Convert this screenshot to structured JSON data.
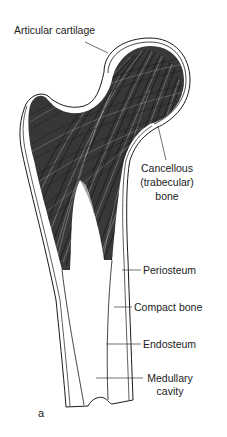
{
  "figure": {
    "panel_letter": "a",
    "colors": {
      "ink": "#1a1a1a",
      "background": "#ffffff"
    }
  },
  "labels": {
    "articular_cartilage": "Articular cartilage",
    "cancellous": [
      "Cancellous",
      "(trabecular)",
      "bone"
    ],
    "periosteum": "Periosteum",
    "compact_bone": "Compact bone",
    "endosteum": "Endosteum",
    "medullary": [
      "Medullary",
      "cavity"
    ]
  }
}
